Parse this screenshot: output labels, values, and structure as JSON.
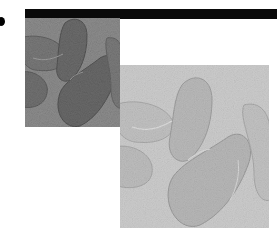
{
  "figure": {
    "bullet_icon": "bullet-dot-icon",
    "top_bar_color": "#0a0a0a",
    "panels": [
      {
        "name": "dark-exposure-image",
        "description": "grayscale close-up of fingers (darker exposure)",
        "background": "#8c8c8c",
        "shape_fill": "#6f6f6f",
        "shape_stroke": "#5a5a5a"
      },
      {
        "name": "light-exposure-image",
        "description": "grayscale close-up of fingers (lighter exposure)",
        "background": "#c9c9c9",
        "shape_fill": "#b4b4b4",
        "shape_stroke": "#9d9d9d"
      }
    ]
  }
}
